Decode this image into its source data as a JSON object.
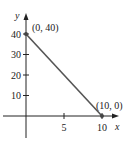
{
  "chart_data": {
    "type": "line",
    "title": "",
    "xlabel": "x",
    "ylabel": "y",
    "xlim": [
      -2.5,
      10.5
    ],
    "ylim": [
      -11,
      50
    ],
    "grid": false,
    "x_ticks": [
      5,
      10
    ],
    "x_tick_labels": [
      "5",
      "10"
    ],
    "y_ticks": [
      10,
      20,
      30,
      40
    ],
    "y_tick_labels": [
      "10",
      "20",
      "30",
      "40"
    ],
    "series": [
      {
        "name": "line",
        "x": [
          0,
          10
        ],
        "y": [
          40,
          0
        ],
        "color": "#555555"
      }
    ],
    "points": [
      {
        "x": 0,
        "y": 40,
        "label": "(0, 40)"
      },
      {
        "x": 10,
        "y": 0,
        "label": "(10, 0)"
      }
    ],
    "axis_color": "#222222"
  }
}
